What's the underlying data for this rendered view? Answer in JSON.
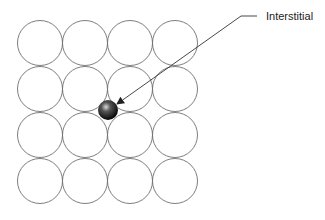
{
  "diagram": {
    "grid": {
      "rows": 4,
      "cols": 4,
      "origin_x": 40,
      "origin_y": 43,
      "spacing_x": 45,
      "spacing_y": 46,
      "radius": 22.5,
      "stroke": "#6e6e6e"
    },
    "interstitial": {
      "cx": 108,
      "cy": 110,
      "r": 10,
      "color": "#111111"
    },
    "callout": {
      "label": "Interstitial",
      "points": "257,16 241,16 117,104"
    }
  }
}
